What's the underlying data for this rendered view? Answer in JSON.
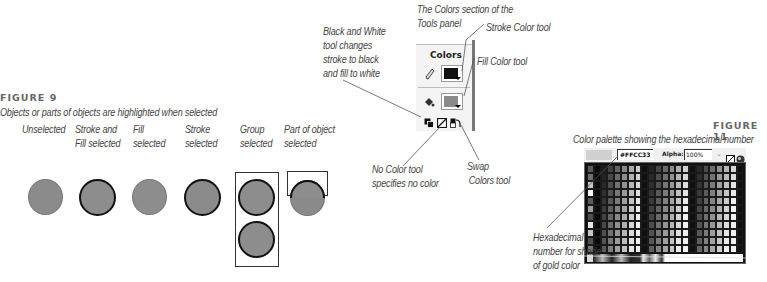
{
  "figure9": {
    "label": "FIGURE 9",
    "caption": "Objects or parts of objects are highlighted when selected",
    "states": [
      {
        "line1": "Unselected",
        "line2": ""
      },
      {
        "line1": "Stroke and",
        "line2": "Fill selected"
      },
      {
        "line1": "Fill",
        "line2": "selected"
      },
      {
        "line1": "Stroke",
        "line2": "selected"
      },
      {
        "line1": "Group",
        "line2": "selected"
      },
      {
        "line1": "Part of object",
        "line2": "selected"
      }
    ]
  },
  "figure10": {
    "caption_line1": "The Colors section of the",
    "caption_line2": "Tools panel",
    "panel_title": "Colors",
    "stroke_color": "#111111",
    "fill_color": "#8a8a8a",
    "callouts": {
      "black_white": [
        "Black and White",
        "tool changes",
        "stroke to black",
        "and fill to white"
      ],
      "stroke": "Stroke Color tool",
      "fill": "Fill Color tool",
      "no_color": [
        "No Color tool",
        "specifies no color"
      ],
      "swap": [
        "Swap",
        "Colors tool"
      ]
    },
    "icons": [
      "pencil-icon",
      "paint-bucket-icon",
      "black-white-icon",
      "no-color-icon",
      "swap-colors-icon"
    ]
  },
  "figure11": {
    "label": "FIGURE 11",
    "caption": "Color palette showing the hexadecimal number",
    "hex_value": "#FFCC33",
    "alpha_label": "Alpha:",
    "alpha_value": "100%",
    "callout": [
      "Hexadecimal",
      "number for shade",
      "of gold color"
    ]
  }
}
